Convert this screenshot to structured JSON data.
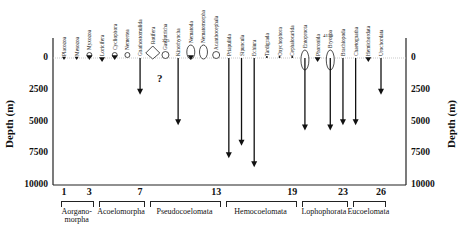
{
  "chart_data": {
    "type": "diagram",
    "title": "",
    "ylabel": "Depth (m)",
    "yticks": [
      0,
      2500,
      5000,
      7500,
      10000
    ],
    "ylim": [
      0,
      10000
    ],
    "xticks": [
      1,
      3,
      7,
      13,
      19,
      23,
      26
    ],
    "groups": [
      {
        "name": "Aorgano-morpha",
        "line1": "Aorgano-",
        "line2": "morpha",
        "from": 1,
        "to": 3
      },
      {
        "name": "Acoelomorpha",
        "from": 4,
        "to": 7
      },
      {
        "name": "Pseudocoelomata",
        "from": 8,
        "to": 13
      },
      {
        "name": "Hemocoelomata",
        "from": 14,
        "to": 19
      },
      {
        "name": "Lophophorata",
        "from": 20,
        "to": 23
      },
      {
        "name": "Eucoelomata",
        "from": 24,
        "to": 26
      }
    ],
    "taxa": [
      {
        "n": 1,
        "name": "Placozoa",
        "max_depth": 0,
        "marker": "small-arrow"
      },
      {
        "n": 2,
        "name": "Mesozoa",
        "max_depth": 0,
        "marker": "small-arrow"
      },
      {
        "n": 3,
        "name": "Myxozoa",
        "max_depth": 0,
        "marker": "circle-arrow"
      },
      {
        "n": 4,
        "name": "Loricifera",
        "max_depth": 0,
        "marker": "arrow"
      },
      {
        "n": 5,
        "name": "Cycliophora",
        "max_depth": 0,
        "marker": "circle-arrow"
      },
      {
        "n": 6,
        "name": "Nemertea",
        "max_depth": 0,
        "marker": "circle"
      },
      {
        "n": 7,
        "name": "Gnathostomulida",
        "max_depth": 2900,
        "marker": "arrow"
      },
      {
        "n": 8,
        "name": "Rotifera",
        "max_depth": 0,
        "marker": "large-diamond"
      },
      {
        "n": 9,
        "name": "Gastrotricha",
        "max_depth": 0,
        "marker": "small-circle",
        "note": "?"
      },
      {
        "n": 10,
        "name": "Kinorhyncha",
        "max_depth": 5300,
        "marker": "arrow"
      },
      {
        "n": 11,
        "name": "Nematoda",
        "max_depth": 0,
        "marker": "oval-arrow"
      },
      {
        "n": 12,
        "name": "Nematomorpha",
        "max_depth": 0,
        "marker": "oval"
      },
      {
        "n": 13,
        "name": "Acanthocephala",
        "max_depth": 0,
        "marker": "small-circle"
      },
      {
        "n": 14,
        "name": "Priapulida",
        "max_depth": 7900,
        "marker": "arrow"
      },
      {
        "n": 15,
        "name": "Sipuncula",
        "max_depth": 6900,
        "marker": "arrow"
      },
      {
        "n": 16,
        "name": "Echiura",
        "max_depth": 8600,
        "marker": "arrow"
      },
      {
        "n": 17,
        "name": "Tardigrada",
        "max_depth": 0,
        "marker": "small"
      },
      {
        "n": 18,
        "name": "Onychophora",
        "max_depth": 0,
        "marker": "small"
      },
      {
        "n": 19,
        "name": "Cephalocarida",
        "max_depth": 0,
        "marker": "small"
      },
      {
        "n": 20,
        "name": "Entoprocta",
        "max_depth": 5700,
        "marker": "oval-arrow"
      },
      {
        "n": 21,
        "name": "Phoronida",
        "max_depth": 0,
        "marker": "arrow"
      },
      {
        "n": 22,
        "name": "Bryozoa",
        "max_depth": 5700,
        "marker": "oval-arrow"
      },
      {
        "n": 23,
        "name": "Brachiopoda",
        "max_depth": 5300,
        "marker": "arrow"
      },
      {
        "n": 24,
        "name": "Chaetognatha",
        "max_depth": 5300,
        "marker": "arrow"
      },
      {
        "n": 25,
        "name": "Hemichordata",
        "max_depth": 0,
        "marker": "arrow"
      },
      {
        "n": 26,
        "name": "Urochordata",
        "max_depth": 2900,
        "marker": "arrow"
      }
    ],
    "annotations": [
      "?",
      "375",
      "4150"
    ]
  },
  "labels": {
    "ylabel_left": "Depth (m)",
    "ylabel_right": "Depth (m)",
    "q": "?",
    "ann1": "375",
    "ann2": "4150"
  }
}
